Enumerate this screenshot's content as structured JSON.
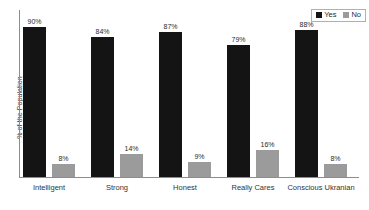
{
  "chart_data": {
    "type": "bar",
    "title": "",
    "xlabel": "",
    "ylabel": "% of the Population",
    "ylim": [
      0,
      100
    ],
    "grid": false,
    "legend_position": "top-right",
    "categories": [
      "Intelligent",
      "Strong",
      "Honest",
      "Really Cares",
      "Conscious Ukranian"
    ],
    "series": [
      {
        "name": "Yes",
        "color": "#141414",
        "values": [
          90,
          84,
          87,
          79,
          88
        ],
        "labels": [
          "90%",
          "84%",
          "87%",
          "79%",
          "88%"
        ]
      },
      {
        "name": "No",
        "color": "#9b9b9b",
        "values": [
          8,
          14,
          9,
          16,
          8
        ],
        "labels": [
          "8%",
          "14%",
          "9%",
          "16%",
          "8%"
        ]
      }
    ]
  },
  "legend": {
    "items": [
      {
        "label": "Yes",
        "color": "#141414"
      },
      {
        "label": "No",
        "color": "#9b9b9b"
      }
    ]
  }
}
